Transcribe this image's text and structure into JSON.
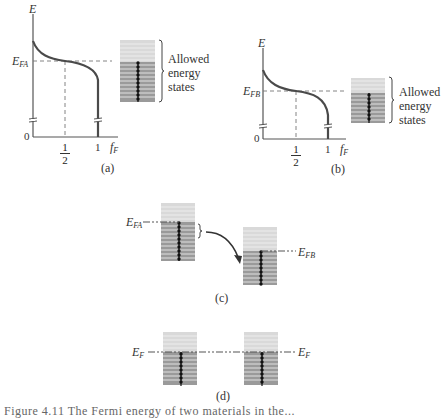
{
  "figure": {
    "panels": {
      "a": {
        "label": "(a)",
        "axis_y_label": "E",
        "axis_x_label": "f",
        "axis_x_sub": "F",
        "origin_label": "0",
        "fermi_label_main": "E",
        "fermi_label_sub": "FA",
        "tick_half_num": "1",
        "tick_half_den": "2",
        "tick_one": "1",
        "legend_lines": [
          "Allowed",
          "energy",
          "states"
        ]
      },
      "b": {
        "label": "(b)",
        "axis_y_label": "E",
        "axis_x_label": "f",
        "axis_x_sub": "F",
        "origin_label": "0",
        "fermi_label_main": "E",
        "fermi_label_sub": "FB",
        "tick_half_num": "1",
        "tick_half_den": "2",
        "tick_one": "1",
        "legend_lines": [
          "Allowed",
          "energy",
          "states"
        ]
      },
      "c": {
        "label": "(c)",
        "left_fermi_main": "E",
        "left_fermi_sub": "FA",
        "right_fermi_main": "E",
        "right_fermi_sub": "FB"
      },
      "d": {
        "label": "(d)",
        "left_fermi_main": "E",
        "left_fermi_sub": "F",
        "right_fermi_main": "E",
        "right_fermi_sub": "F"
      }
    },
    "caption_clipped": "Figure 4.11  The Fermi energy of two materials in the..."
  },
  "colors": {
    "empty_band": "#d9d9d9",
    "filled_band": "#9a9a9a",
    "band_line": "#f2f2f2",
    "dot": "#111111",
    "curve": "#4a4a4a",
    "axis": "#555555",
    "dash": "#777777"
  }
}
